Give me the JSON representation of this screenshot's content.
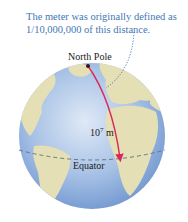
{
  "caption": {
    "line1": "The meter was originally defined as",
    "line2": "1/10,000,000 of this distance."
  },
  "labels": {
    "north_pole": "North Pole",
    "distance_base": "10",
    "distance_exp": "7",
    "distance_unit": " m",
    "equator": "Equator"
  },
  "colors": {
    "ocean": "#8fb0dc",
    "land": "#e4dfb4",
    "meridian_arrow": "#d82a5a",
    "caption": "#3f78b5",
    "equator_line": "#55708a"
  }
}
